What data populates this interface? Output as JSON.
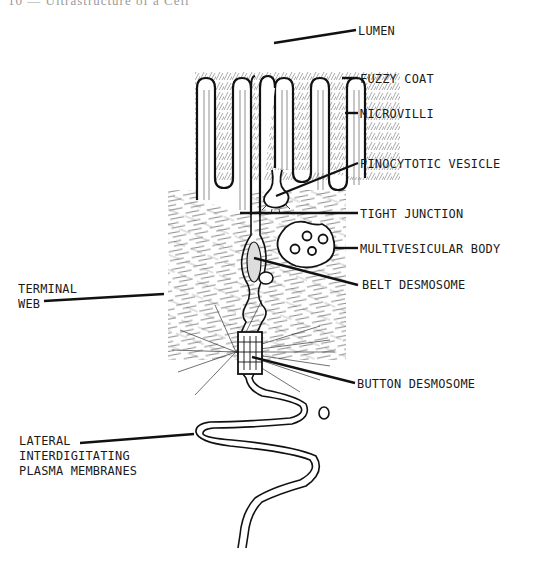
{
  "page": {
    "header": "10 — Ultrastructure of a Cell",
    "figure_type": "Labeled schematic of intestinal epithelial cell junction"
  },
  "labels": {
    "lumen": "LUMEN",
    "fuzzy_coat": "FUZZY COAT",
    "microvilli": "MICROVILLI",
    "pinocytotic_vesicle": "PINOCYTOTIC VESICLE",
    "tight_junction": "TIGHT JUNCTION",
    "multivesicular_body": "MULTIVESICULAR BODY",
    "belt_desmosome": "BELT DESMOSOME",
    "terminal_web": "TERMINAL\nWEB",
    "button_desmosome": "BUTTON DESMOSOME",
    "lateral_membranes": "LATERAL\nINTERDIGITATING\nPLASMA MEMBRANES"
  },
  "colors": {
    "ink": "#1a1a1a",
    "background": "#ffffff",
    "header": "#9a9a9a"
  }
}
